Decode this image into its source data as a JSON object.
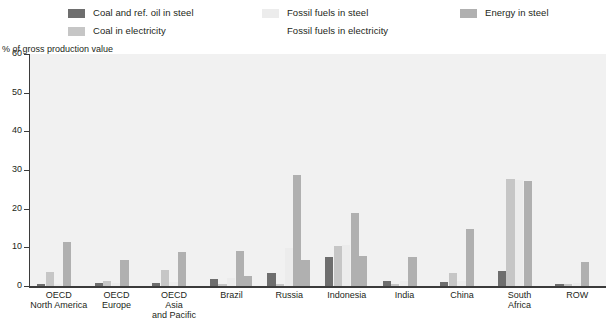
{
  "legend": {
    "columns": [
      [
        {
          "label": "Coal and ref. oil in steel",
          "color": "#6e6e6e",
          "key": "coal_oil_steel"
        },
        {
          "label": "Coal in electricity",
          "color": "#c6c6c6",
          "key": "coal_electricity"
        }
      ],
      [
        {
          "label": "Fossil fuels in steel",
          "color": "#ececec",
          "key": "fossil_steel"
        },
        {
          "label": "Fossil fuels in electricity",
          "color": "#dcdcdc",
          "key": "fossil_electricity"
        }
      ],
      [
        {
          "label": "Energy in steel",
          "color": "#b0b0b0",
          "key": "energy_steel"
        }
      ]
    ]
  },
  "chart_data": {
    "type": "bar",
    "title": "",
    "xlabel": "",
    "ylabel": "% of gross production value",
    "ylim": [
      0,
      60
    ],
    "yticks": [
      0,
      10,
      20,
      30,
      40,
      50,
      60
    ],
    "grid": false,
    "legend_position": "top",
    "categories": [
      "OECD\nNorth America",
      "OECD\nEurope",
      "OECD\nAsia\nand Pacific",
      "Brazil",
      "Russia",
      "Indonesia",
      "India",
      "China",
      "South\nAfrica",
      "ROW"
    ],
    "category_labels": [
      [
        "OECD",
        "North America"
      ],
      [
        "OECD",
        "Europe"
      ],
      [
        "OECD",
        "Asia",
        "and Pacific"
      ],
      [
        "Brazil"
      ],
      [
        "Russia"
      ],
      [
        "Indonesia"
      ],
      [
        "India"
      ],
      [
        "China"
      ],
      [
        "South",
        "Africa"
      ],
      [
        "ROW"
      ]
    ],
    "series": [
      {
        "name": "Coal and ref. oil in steel",
        "color": "#6e6e6e",
        "values": [
          0.5,
          0.7,
          0.9,
          1.8,
          3.3,
          7.4,
          1.2,
          1.1,
          4.0,
          0.6
        ]
      },
      {
        "name": "Coal in electricity",
        "color": "#c6c6c6",
        "values": [
          3.6,
          1.2,
          4.2,
          0.4,
          0.6,
          10.3,
          0.5,
          3.3,
          27.6,
          0.5
        ]
      },
      {
        "name": "Fossil fuels in steel",
        "color": "#ececec",
        "values": [
          0.6,
          0.8,
          1.0,
          2.0,
          9.8,
          10.6,
          1.4,
          1.3,
          27.5,
          0.8
        ]
      },
      {
        "name": "Fossil fuels in electricity",
        "color": "#dcdcdc",
        "values": [
          0.7,
          0.9,
          1.1,
          2.3,
          1.0,
          1.1,
          0.7,
          1.0,
          1.2,
          0.7
        ]
      },
      {
        "name": "Energy in steel",
        "color": "#b0b0b0",
        "values": [
          11.4,
          6.8,
          8.9,
          9.0,
          28.6,
          19.0,
          7.4,
          14.7,
          27.2,
          6.2
        ]
      }
    ],
    "series_secondary": [
      {
        "name": "Energy in steel second",
        "color": "#b0b0b0",
        "values": [
          null,
          null,
          null,
          2.7,
          6.6,
          7.7,
          null,
          null,
          null,
          null
        ]
      }
    ]
  }
}
